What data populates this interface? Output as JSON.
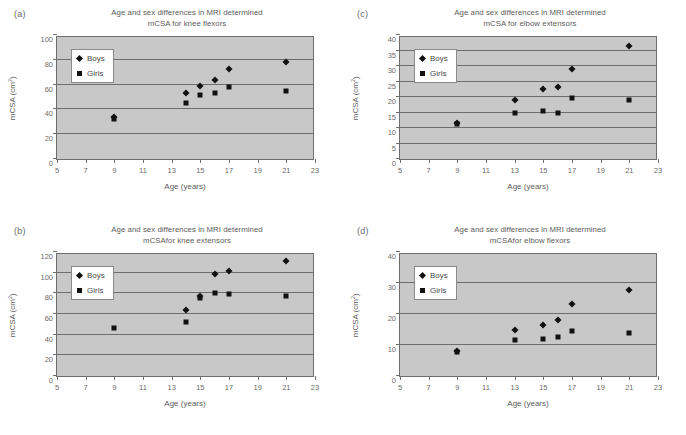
{
  "figure": {
    "shared": {
      "xlabel": "Age (years)",
      "ylabel": "mCSA (cm",
      "ylabel_sup": "2",
      "ylabel_tail": ")",
      "legend": {
        "boys": "Boys",
        "girls": "Girls"
      },
      "title_line1": "Age and sex differences in MRI determined",
      "xticks": [
        5,
        7,
        9,
        11,
        13,
        15,
        17,
        19,
        21,
        23
      ],
      "xlim": [
        5,
        23
      ]
    },
    "panels": [
      {
        "tag": "(a)",
        "title_line2": "mCSA for knee flexors",
        "yticks": [
          0,
          20,
          40,
          60,
          80,
          100
        ],
        "ylim": [
          0,
          100
        ]
      },
      {
        "tag": "(c)",
        "title_line2": "mCSA for elbow extensors",
        "yticks": [
          0,
          5,
          10,
          15,
          20,
          25,
          30,
          35,
          40
        ],
        "ylim": [
          0,
          40
        ]
      },
      {
        "tag": "(b)",
        "title_line2": "mCSAfor knee extensors",
        "yticks": [
          0,
          20,
          40,
          60,
          80,
          100,
          120
        ],
        "ylim": [
          0,
          120
        ]
      },
      {
        "tag": "(d)",
        "title_line2": "mCSAfor elbow flexors",
        "yticks": [
          0,
          10,
          20,
          30,
          40
        ],
        "ylim": [
          0,
          40
        ]
      }
    ]
  },
  "chart_data": [
    {
      "type": "scatter",
      "panel": "(a)",
      "title": "Age and sex differences in MRI determined mCSA for knee flexors",
      "xlabel": "Age (years)",
      "ylabel": "mCSA (cm2)",
      "xlim": [
        5,
        23
      ],
      "ylim": [
        0,
        100
      ],
      "grid": true,
      "legend_position": "upper-left",
      "series": [
        {
          "name": "Boys",
          "points": [
            [
              9,
              35.5
            ],
            [
              14,
              55.5
            ],
            [
              15,
              60.5
            ],
            [
              16,
              66
            ],
            [
              17,
              75
            ],
            [
              21,
              80.5
            ]
          ]
        },
        {
          "name": "Girls",
          "points": [
            [
              9,
              34.5
            ],
            [
              14,
              47.5
            ],
            [
              15,
              53.5
            ],
            [
              16,
              55
            ],
            [
              17,
              60
            ],
            [
              21,
              57
            ]
          ]
        }
      ]
    },
    {
      "type": "scatter",
      "panel": "(c)",
      "title": "Age and sex differences in MRI determined mCSA for elbow extensors",
      "xlabel": "Age (years)",
      "ylabel": "mCSA (cm2)",
      "xlim": [
        5,
        23
      ],
      "ylim": [
        0,
        40
      ],
      "grid": true,
      "legend_position": "upper-left",
      "series": [
        {
          "name": "Boys",
          "points": [
            [
              9,
              12.5
            ],
            [
              13,
              19.7
            ],
            [
              15,
              23.3
            ],
            [
              16,
              24.1
            ],
            [
              17,
              30
            ],
            [
              21,
              37.2
            ]
          ]
        },
        {
          "name": "Girls",
          "points": [
            [
              9,
              12
            ],
            [
              13,
              15.8
            ],
            [
              15,
              16.4
            ],
            [
              16,
              15.8
            ],
            [
              17,
              20.6
            ],
            [
              21,
              19.7
            ]
          ]
        }
      ]
    },
    {
      "type": "scatter",
      "panel": "(b)",
      "title": "Age and sex differences in MRI determined mCSAfor knee extensors",
      "xlabel": "Age (years)",
      "ylabel": "mCSA (cm2)",
      "xlim": [
        5,
        23
      ],
      "ylim": [
        0,
        120
      ],
      "grid": true,
      "legend_position": "upper-left",
      "series": [
        {
          "name": "Boys",
          "points": [
            [
              14,
              66
            ],
            [
              15,
              79.5
            ],
            [
              16,
              101
            ],
            [
              17,
              104
            ],
            [
              21,
              113.5
            ]
          ]
        },
        {
          "name": "Girls",
          "points": [
            [
              9,
              48.5
            ],
            [
              14,
              54.5
            ],
            [
              15,
              77.5
            ],
            [
              16,
              82.5
            ],
            [
              17,
              81.5
            ],
            [
              21,
              80
            ]
          ]
        }
      ]
    },
    {
      "type": "scatter",
      "panel": "(d)",
      "title": "Age and sex differences in MRI determined mCSAfor elbow flexors",
      "xlabel": "Age (years)",
      "ylabel": "mCSA (cm2)",
      "xlim": [
        5,
        23
      ],
      "ylim": [
        0,
        40
      ],
      "grid": true,
      "legend_position": "upper-left",
      "series": [
        {
          "name": "Boys",
          "points": [
            [
              9,
              9
            ],
            [
              13,
              15.6
            ],
            [
              15,
              17.4
            ],
            [
              16,
              19
            ],
            [
              17,
              24.1
            ],
            [
              21,
              28.4
            ]
          ]
        },
        {
          "name": "Girls",
          "points": [
            [
              9,
              8.6
            ],
            [
              13,
              12.5
            ],
            [
              15,
              12.8
            ],
            [
              16,
              13.3
            ],
            [
              17,
              15.4
            ],
            [
              21,
              14.7
            ]
          ]
        }
      ]
    }
  ]
}
